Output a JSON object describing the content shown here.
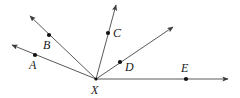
{
  "figure": {
    "type": "geometry-diagram",
    "background_color": "#ffffff",
    "line_color": "#5a5a5a",
    "dot_color": "#111111",
    "label_color": "#1a1a1a",
    "width": 240,
    "height": 98,
    "vertex": {
      "name": "X",
      "label": "X",
      "x": 96,
      "y": 79,
      "label_x": 91,
      "label_y": 84
    },
    "points": [
      {
        "name": "A",
        "label": "A",
        "x": 35,
        "y": 55,
        "label_x": 29,
        "label_y": 59
      },
      {
        "name": "B",
        "label": "B",
        "x": 49,
        "y": 35,
        "label_x": 43,
        "label_y": 39
      },
      {
        "name": "C",
        "label": "C",
        "x": 108,
        "y": 33,
        "label_x": 113,
        "label_y": 27
      },
      {
        "name": "D",
        "label": "D",
        "x": 120,
        "y": 62,
        "label_x": 125,
        "label_y": 61
      },
      {
        "name": "E",
        "label": "E",
        "x": 186,
        "y": 79,
        "label_x": 181,
        "label_y": 62
      }
    ],
    "rays": [
      {
        "name": "ray-XA",
        "through": "A",
        "tip_x": 12,
        "tip_y": 45
      },
      {
        "name": "ray-XB",
        "through": "B",
        "tip_x": 30,
        "tip_y": 16
      },
      {
        "name": "ray-XC",
        "through": "C",
        "tip_x": 116,
        "tip_y": 5
      },
      {
        "name": "ray-XD",
        "through": "D",
        "tip_x": 173,
        "tip_y": 27
      },
      {
        "name": "ray-XE",
        "through": "E",
        "tip_x": 228,
        "tip_y": 79
      }
    ]
  }
}
